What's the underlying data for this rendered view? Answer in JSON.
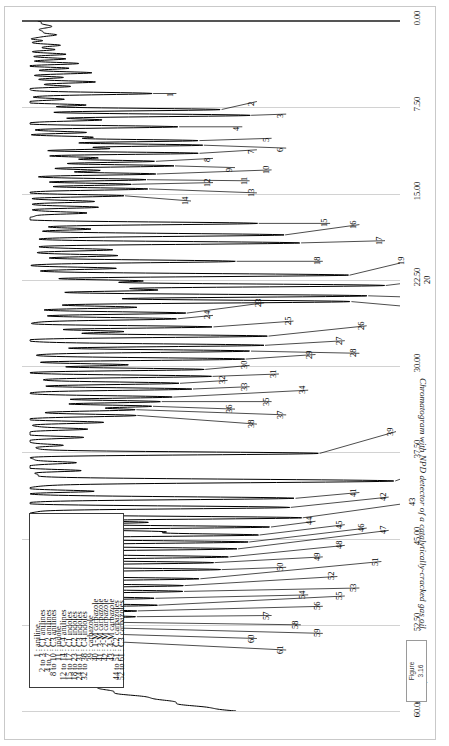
{
  "figure": {
    "label_line1": "Figure",
    "label_line2": "3.16",
    "caption": "Chromatogram with NPD detector of a catalytically-cracked gas oil."
  },
  "chart_data": {
    "type": "line",
    "title": "Chromatogram with NPD detector of a catalytically-cracked gas oil.",
    "xlabel": "Time, minutes",
    "ylabel": "",
    "xlim": [
      0.0,
      60.0
    ],
    "xticks": [
      "0.00",
      "7.50",
      "15.00",
      "22.50",
      "30.00",
      "37.50",
      "45.00",
      "52.50",
      "60.00"
    ],
    "xtick_values": [
      0.0,
      7.5,
      15.0,
      22.5,
      30.0,
      37.5,
      45.0,
      52.5,
      60.0
    ],
    "grid": true,
    "legend_position": "inside-lower-left",
    "detector": "NPD",
    "sample": "catalytically-cracked gas oil",
    "peak_labels": [
      {
        "n": "1",
        "t": 6.3
      },
      {
        "n": "2",
        "t": 7.7
      },
      {
        "n": "3",
        "t": 8.2
      },
      {
        "n": "4",
        "t": 9.2
      },
      {
        "n": "5",
        "t": 10.4
      },
      {
        "n": "6",
        "t": 10.8
      },
      {
        "n": "7",
        "t": 11.5
      },
      {
        "n": "8",
        "t": 12.2
      },
      {
        "n": "9",
        "t": 12.6
      },
      {
        "n": "10",
        "t": 13.3
      },
      {
        "n": "11",
        "t": 13.8
      },
      {
        "n": "12",
        "t": 14.2
      },
      {
        "n": "13",
        "t": 14.6
      },
      {
        "n": "14",
        "t": 15.2
      },
      {
        "n": "15",
        "t": 17.6
      },
      {
        "n": "16",
        "t": 18.6
      },
      {
        "n": "17",
        "t": 19.3
      },
      {
        "n": "18",
        "t": 20.9
      },
      {
        "n": "19",
        "t": 22.1
      },
      {
        "n": "20",
        "t": 23.0
      },
      {
        "n": "21",
        "t": 23.9
      },
      {
        "n": "22",
        "t": 24.4
      },
      {
        "n": "23",
        "t": 25.4
      },
      {
        "n": "24",
        "t": 25.9
      },
      {
        "n": "25",
        "t": 26.6
      },
      {
        "n": "26",
        "t": 27.4
      },
      {
        "n": "27",
        "t": 28.2
      },
      {
        "n": "28",
        "t": 28.7
      },
      {
        "n": "29",
        "t": 29.4
      },
      {
        "n": "30",
        "t": 30.3
      },
      {
        "n": "31",
        "t": 30.9
      },
      {
        "n": "32",
        "t": 31.5
      },
      {
        "n": "33",
        "t": 32.0
      },
      {
        "n": "34",
        "t": 32.7
      },
      {
        "n": "35",
        "t": 33.1
      },
      {
        "n": "36",
        "t": 33.5
      },
      {
        "n": "37",
        "t": 33.8
      },
      {
        "n": "38",
        "t": 34.3
      },
      {
        "n": "39",
        "t": 37.6
      },
      {
        "n": "40",
        "t": 40.0
      },
      {
        "n": "41",
        "t": 41.5
      },
      {
        "n": "42",
        "t": 42.3
      },
      {
        "n": "43",
        "t": 43.2
      },
      {
        "n": "44",
        "t": 44.0
      },
      {
        "n": "45",
        "t": 44.7
      },
      {
        "n": "46",
        "t": 45.3
      },
      {
        "n": "47",
        "t": 45.9
      },
      {
        "n": "48",
        "t": 46.6
      },
      {
        "n": "49",
        "t": 47.1
      },
      {
        "n": "50",
        "t": 47.7
      },
      {
        "n": "51",
        "t": 48.5
      },
      {
        "n": "52",
        "t": 49.1
      },
      {
        "n": "53",
        "t": 49.6
      },
      {
        "n": "54",
        "t": 50.2
      },
      {
        "n": "55",
        "t": 50.8
      },
      {
        "n": "56",
        "t": 51.3
      },
      {
        "n": "57",
        "t": 51.8
      },
      {
        "n": "58",
        "t": 52.3
      },
      {
        "n": "59",
        "t": 52.8
      },
      {
        "n": "60",
        "t": 53.3
      },
      {
        "n": "61",
        "t": 53.9
      }
    ]
  },
  "legend": {
    "rows": [
      {
        "range": "1",
        "name": "aniline"
      },
      {
        "range": "2 to 3",
        "name": "C1 anilines"
      },
      {
        "range": "4 to 7",
        "name": "C2 anilines"
      },
      {
        "range": "8 to 10",
        "name": "C3 anilines"
      },
      {
        "range": "11",
        "name": "indole"
      },
      {
        "range": "12 to 14",
        "name": "C4 anilines"
      },
      {
        "range": "15 to 17",
        "name": "C1 indoles"
      },
      {
        "range": "18 to 23",
        "name": "C2 indoles"
      },
      {
        "range": "24 to 31",
        "name": "C3 indoles"
      },
      {
        "range": "32 to 38",
        "name": "C4 indoles"
      },
      {
        "range": "39",
        "name": "carbazole"
      },
      {
        "range": "40",
        "name": "1-M carbazole"
      },
      {
        "range": "41",
        "name": "3-M carbazole"
      },
      {
        "range": "42",
        "name": "2-M carbazole"
      },
      {
        "range": "43",
        "name": "4-M carbazole"
      },
      {
        "range": "44 to 51",
        "name": "C2 carbazoles"
      },
      {
        "range": "52 to 61",
        "name": "C3 carbazoles"
      }
    ]
  }
}
